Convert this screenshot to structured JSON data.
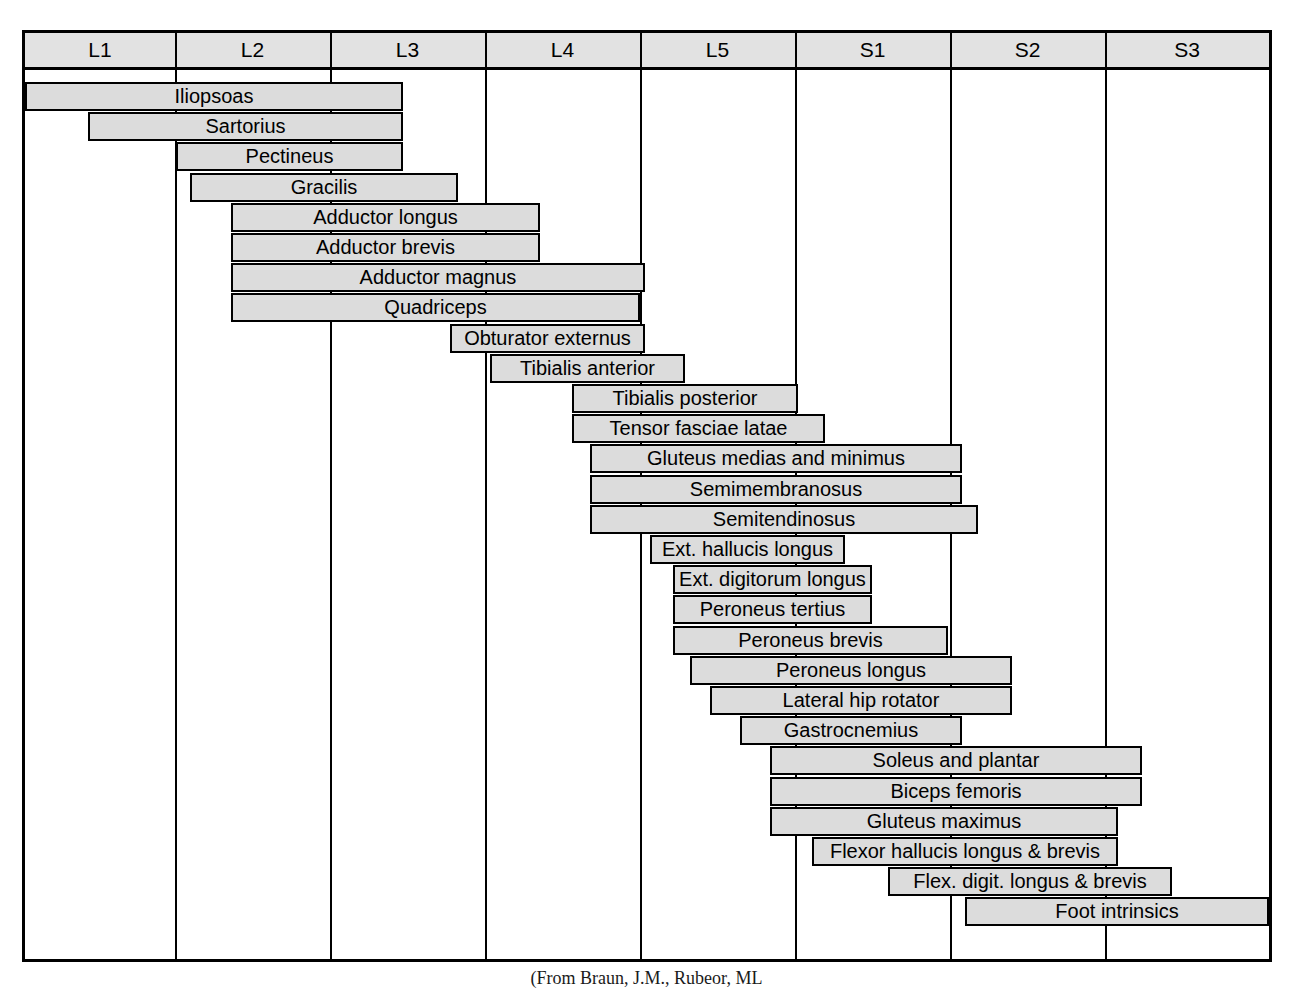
{
  "figure": {
    "caption": "(From Braun, J.M., Rubeor, ML"
  },
  "chart_data": {
    "type": "bar",
    "orientation": "horizontal",
    "xlabel": "",
    "ylabel": "",
    "grid": true,
    "legend": "none",
    "categories": [
      "L1",
      "L2",
      "L3",
      "L4",
      "L5",
      "S1",
      "S2",
      "S3"
    ],
    "x_axis_note": "Eight spinal nerve root columns from L1 to S3, equal width",
    "column_edges_px": [
      25,
      175,
      330,
      485,
      640,
      795,
      950,
      1105,
      1269
    ],
    "rows": [
      {
        "label": "Iliopsoas",
        "start": 25,
        "end": 403,
        "roots": "L1-L3"
      },
      {
        "label": "Sartorius",
        "start": 88,
        "end": 403,
        "roots": "L2-L3"
      },
      {
        "label": "Pectineus",
        "start": 176,
        "end": 403,
        "roots": "L2-L3"
      },
      {
        "label": "Gracilis",
        "start": 190,
        "end": 458,
        "roots": "L2-L4"
      },
      {
        "label": "Adductor longus",
        "start": 231,
        "end": 540,
        "roots": "L2-L4"
      },
      {
        "label": "Adductor brevis",
        "start": 231,
        "end": 540,
        "roots": "L2-L4"
      },
      {
        "label": "Adductor magnus",
        "start": 231,
        "end": 645,
        "roots": "L2-L5"
      },
      {
        "label": "Quadriceps",
        "start": 231,
        "end": 640,
        "roots": "L2-L4"
      },
      {
        "label": "Obturator externus",
        "start": 450,
        "end": 645,
        "roots": "L3-L4"
      },
      {
        "label": "Tibialis anterior",
        "start": 490,
        "end": 685,
        "roots": "L4-L5"
      },
      {
        "label": "Tibialis posterior",
        "start": 572,
        "end": 798,
        "roots": "L4-S1"
      },
      {
        "label": "Tensor fasciae latae",
        "start": 572,
        "end": 825,
        "roots": "L4-S1"
      },
      {
        "label": "Gluteus medias and minimus",
        "start": 590,
        "end": 962,
        "roots": "L4-S2"
      },
      {
        "label": "Semimembranosus",
        "start": 590,
        "end": 962,
        "roots": "L4-S2"
      },
      {
        "label": "Semitendinosus",
        "start": 590,
        "end": 978,
        "roots": "L4-S2"
      },
      {
        "label": "Ext. hallucis longus",
        "start": 650,
        "end": 845,
        "roots": "L5-S1"
      },
      {
        "label": "Ext. digitorum longus",
        "start": 673,
        "end": 872,
        "roots": "L5-S1"
      },
      {
        "label": "Peroneus tertius",
        "start": 673,
        "end": 872,
        "roots": "L5-S1"
      },
      {
        "label": "Peroneus brevis",
        "start": 673,
        "end": 948,
        "roots": "L5-S1"
      },
      {
        "label": "Peroneus longus",
        "start": 690,
        "end": 1012,
        "roots": "L5-S2"
      },
      {
        "label": "Lateral hip rotator",
        "start": 710,
        "end": 1012,
        "roots": "L5-S2"
      },
      {
        "label": "Gastrocnemius",
        "start": 740,
        "end": 962,
        "roots": "L5-S2"
      },
      {
        "label": "Soleus and plantar",
        "start": 770,
        "end": 1142,
        "roots": "S1-S2"
      },
      {
        "label": "Biceps femoris",
        "start": 770,
        "end": 1142,
        "roots": "S1-S2"
      },
      {
        "label": "Gluteus maximus",
        "start": 770,
        "end": 1118,
        "roots": "S1-S2"
      },
      {
        "label": "Flexor hallucis longus & brevis",
        "start": 812,
        "end": 1118,
        "roots": "S1-S2"
      },
      {
        "label": "Flex. digit. longus & brevis",
        "start": 888,
        "end": 1172,
        "roots": "S1-S3"
      },
      {
        "label": "Foot intrinsics",
        "start": 965,
        "end": 1269,
        "roots": "S2-S3"
      }
    ]
  },
  "header": {
    "cells": [
      {
        "label": "L1"
      },
      {
        "label": "L2"
      },
      {
        "label": "L3"
      },
      {
        "label": "L4"
      },
      {
        "label": "L5"
      },
      {
        "label": "S1"
      },
      {
        "label": "S2"
      },
      {
        "label": "S3"
      }
    ]
  },
  "colors": {
    "bar_fill": "#dcdcdc",
    "header_fill": "#e2e2e2",
    "line": "#000000",
    "background": "#ffffff"
  }
}
